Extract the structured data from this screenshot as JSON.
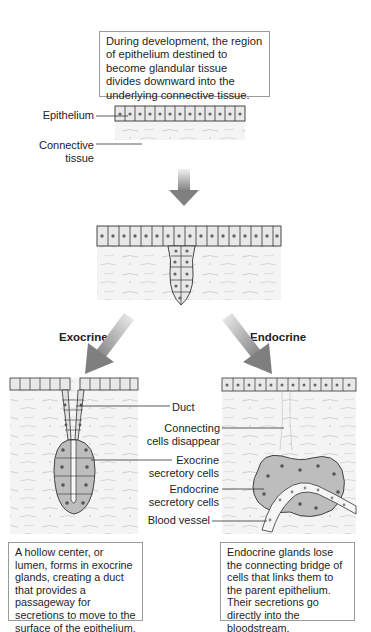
{
  "intro_callout": {
    "text": "During development, the region of epithelium destined to become glandular tissue divides downward into the underlying connective tissue."
  },
  "stage1": {
    "labels": {
      "epithelium": "Epithelium",
      "connective_tissue_line1": "Connective",
      "connective_tissue_line2": "tissue"
    }
  },
  "branches": {
    "exocrine": "Exocrine",
    "endocrine": "Endocrine"
  },
  "center_labels": {
    "duct": "Duct",
    "connecting_line1": "Connecting",
    "connecting_line2": "cells disappear",
    "exocrine_line1": "Exocrine",
    "exocrine_line2": "secretory cells",
    "endocrine_line1": "Endocrine",
    "endocrine_line2": "secretory cells",
    "blood_vessel": "Blood vessel"
  },
  "exocrine_callout": {
    "text": "A hollow center, or lumen, forms in exocrine glands, creating a duct that provides a passageway for secretions to move to the surface of the epithelium."
  },
  "endocrine_callout": {
    "text": "Endocrine glands lose the connecting bridge of cells that links them to the parent epithelium. Their secretions go directly into the bloodstream."
  },
  "colors": {
    "cell_fill": "#e6e6e6",
    "secretory_cell_fill": "#b9b9b9",
    "nucleus": "#6a6a6a",
    "connective_tissue": "#f3f3f3",
    "arrow": "#8a8a8a",
    "callout_border": "#9a9a9a"
  }
}
